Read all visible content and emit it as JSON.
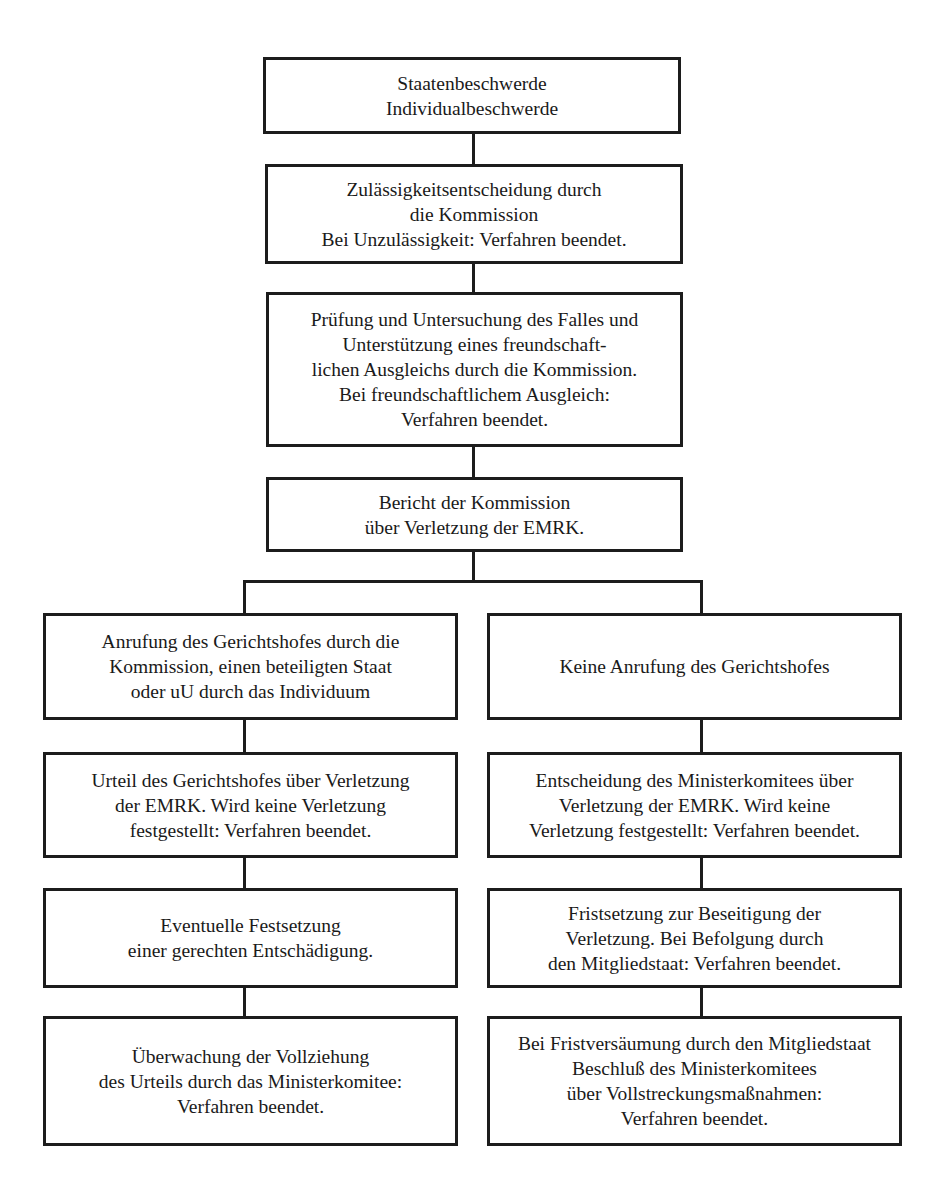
{
  "diagram": {
    "type": "flowchart",
    "main_chain": [
      {
        "id": "b1",
        "text": "Staatenbeschwerde\nIndividualbeschwerde"
      },
      {
        "id": "b2",
        "text": "Zulässigkeitsentscheidung durch\ndie Kommission\nBei Unzulässigkeit: Verfahren beendet."
      },
      {
        "id": "b3",
        "text": "Prüfung und Untersuchung des Falles und\nUnterstützung eines freundschaft-\nlichen Ausgleichs durch die Kommission.\nBei freundschaftlichem Ausgleich:\nVerfahren beendet."
      },
      {
        "id": "b4",
        "text": "Bericht der Kommission\nüber Verletzung der EMRK."
      }
    ],
    "left_branch": [
      {
        "id": "l1",
        "text": "Anrufung des Gerichtshofes durch die\nKommission, einen beteiligten Staat\noder uU durch das Individuum"
      },
      {
        "id": "l2",
        "text": "Urteil des Gerichtshofes über Verletzung\nder EMRK. Wird keine Verletzung\nfestgestellt: Verfahren beendet."
      },
      {
        "id": "l3",
        "text": "Eventuelle Festsetzung\neiner gerechten Entschädigung."
      },
      {
        "id": "l4",
        "text": "Überwachung der Vollziehung\ndes Urteils durch das Ministerkomitee:\nVerfahren beendet."
      }
    ],
    "right_branch": [
      {
        "id": "r1",
        "text": "Keine Anrufung des Gerichtshofes"
      },
      {
        "id": "r2",
        "text": "Entscheidung des Ministerkomitees über\nVerletzung der EMRK. Wird keine\nVerletzung festgestellt: Verfahren beendet."
      },
      {
        "id": "r3",
        "text": "Fristsetzung zur Beseitigung der\nVerletzung. Bei Befolgung durch\nden Mitgliedstaat: Verfahren beendet."
      },
      {
        "id": "r4",
        "text": "Bei Fristversäumung durch den Mitgliedstaat\nBeschluß des Ministerkomitees\nüber Vollstreckungsmaßnahmen:\nVerfahren beendet."
      }
    ],
    "colors": {
      "line": "#1c1c1c",
      "background": "#ffffff",
      "text": "#1a1a1a"
    }
  }
}
